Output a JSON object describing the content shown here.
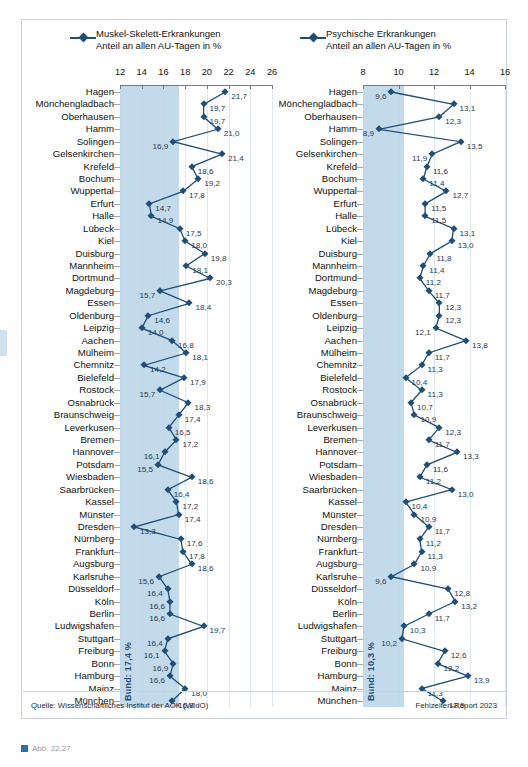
{
  "figure": {
    "source_note": "Quelle: Wissenschaftliches Institut der AOK (WIdO)",
    "report_note": "Fehlzeiten-Report 2023",
    "caption": "Abb. 22.27",
    "accent_color": "#1f4e79",
    "band_color": "#b9d3e8"
  },
  "chart_data": [
    {
      "type": "line",
      "id": "muskel-skelett",
      "title": "Muskel-Skelett-Erkrankungen",
      "subtitle": "Anteil an allen AU-Tagen in %",
      "orientation": "horizontal",
      "xlabel": "Anteil an allen AU-Tagen in %",
      "ylabel": "",
      "xlim": [
        12,
        26
      ],
      "xticks": [
        12,
        14,
        16,
        18,
        20,
        22,
        24,
        26
      ],
      "grid": true,
      "legend_position": "top",
      "reference_band": {
        "label": "Bund: 17,4 %",
        "from": 12,
        "to": 17.4
      },
      "categories": [
        "Hagen",
        "Mönchengladbach",
        "Oberhausen",
        "Hamm",
        "Solingen",
        "Gelsenkirchen",
        "Krefeld",
        "Bochum",
        "Wuppertal",
        "Erfurt",
        "Halle",
        "Lübeck",
        "Kiel",
        "Duisburg",
        "Mannheim",
        "Dortmund",
        "Magdeburg",
        "Essen",
        "Oldenburg",
        "Leipzig",
        "Aachen",
        "Mülheim",
        "Chemnitz",
        "Bielefeld",
        "Rostock",
        "Osnabrück",
        "Braunschweig",
        "Leverkusen",
        "Bremen",
        "Hannover",
        "Potsdam",
        "Wiesbaden",
        "Saarbrücken",
        "Kassel",
        "Münster",
        "Dresden",
        "Nürnberg",
        "Frankfurt",
        "Augsburg",
        "Karlsruhe",
        "Düsseldorf",
        "Köln",
        "Berlin",
        "Ludwigshafen",
        "Stuttgart",
        "Freiburg",
        "Bonn",
        "Hamburg",
        "Mainz",
        "München"
      ],
      "values": [
        21.7,
        19.7,
        19.7,
        21.0,
        16.9,
        21.4,
        18.6,
        19.2,
        17.8,
        14.7,
        14.9,
        17.5,
        18.0,
        19.8,
        18.1,
        20.3,
        15.7,
        18.4,
        14.6,
        14.0,
        16.8,
        18.1,
        14.2,
        17.9,
        15.7,
        18.3,
        17.4,
        16.5,
        17.2,
        16.1,
        15.5,
        18.6,
        16.4,
        17.2,
        17.4,
        13.3,
        17.6,
        17.8,
        18.6,
        15.6,
        16.4,
        16.6,
        16.6,
        19.7,
        16.4,
        16.1,
        16.9,
        16.6,
        18.0,
        16.8
      ],
      "value_labels": [
        "21,7",
        "19,7",
        "19,7",
        "21,0",
        "16,9",
        "21,4",
        "18,6",
        "19,2",
        "17,8",
        "14,7",
        "14,9",
        "17,5",
        "18,0",
        "19,8",
        "18,1",
        "20,3",
        "15,7",
        "18,4",
        "14,6",
        "14,0",
        "16,8",
        "18,1",
        "14,2",
        "17,9",
        "15,7",
        "18,3",
        "17,4",
        "16,5",
        "17,2",
        "16,1",
        "15,5",
        "18,6",
        "16,4",
        "17,2",
        "17,4",
        "13,3",
        "17,6",
        "17,8",
        "18,6",
        "15,6",
        "16,4",
        "16,6",
        "16,6",
        "19,7",
        "16,4",
        "16,1",
        "16,9",
        "16,6",
        "18,0",
        "16,8"
      ],
      "label_side": [
        "r",
        "r",
        "r",
        "r",
        "l",
        "r",
        "r",
        "r",
        "r",
        "r",
        "r",
        "r",
        "r",
        "r",
        "r",
        "r",
        "l",
        "r",
        "r",
        "r",
        "r",
        "r",
        "r",
        "r",
        "l",
        "r",
        "r",
        "r",
        "r",
        "l",
        "l",
        "r",
        "r",
        "r",
        "r",
        "r",
        "r",
        "r",
        "r",
        "l",
        "l",
        "l",
        "l",
        "r",
        "l",
        "l",
        "l",
        "l",
        "r",
        "r"
      ]
    },
    {
      "type": "line",
      "id": "psychische",
      "title": "Psychische Erkrankungen",
      "subtitle": "Anteil an allen AU-Tagen in %",
      "orientation": "horizontal",
      "xlabel": "Anteil an allen AU-Tagen in %",
      "ylabel": "",
      "xlim": [
        8,
        16
      ],
      "xticks": [
        8,
        10,
        12,
        14,
        16
      ],
      "grid": true,
      "legend_position": "top",
      "reference_band": {
        "label": "Bund: 10,3 %",
        "from": 8,
        "to": 10.3
      },
      "categories": [
        "Hagen",
        "Mönchengladbach",
        "Oberhausen",
        "Hamm",
        "Solingen",
        "Gelsenkirchen",
        "Krefeld",
        "Bochum",
        "Wuppertal",
        "Erfurt",
        "Halle",
        "Lübeck",
        "Kiel",
        "Duisburg",
        "Mannheim",
        "Dortmund",
        "Magdeburg",
        "Essen",
        "Oldenburg",
        "Leipzig",
        "Aachen",
        "Mülheim",
        "Chemnitz",
        "Bielefeld",
        "Rostock",
        "Osnabrück",
        "Braunschweig",
        "Leverkusen",
        "Bremen",
        "Hannover",
        "Potsdam",
        "Wiesbaden",
        "Saarbrücken",
        "Kassel",
        "Münster",
        "Dresden",
        "Nürnberg",
        "Frankfurt",
        "Augsburg",
        "Karlsruhe",
        "Düsseldorf",
        "Köln",
        "Berlin",
        "Ludwigshafen",
        "Stuttgart",
        "Freiburg",
        "Bonn",
        "Hamburg",
        "Mainz",
        "München"
      ],
      "values": [
        9.6,
        13.1,
        12.3,
        8.9,
        13.5,
        11.9,
        11.6,
        11.4,
        12.7,
        11.5,
        11.5,
        13.1,
        13.0,
        11.8,
        11.4,
        11.2,
        11.7,
        12.3,
        12.3,
        12.1,
        13.8,
        11.7,
        11.3,
        10.4,
        11.3,
        10.7,
        10.9,
        12.3,
        11.7,
        13.3,
        11.6,
        11.2,
        13.0,
        10.4,
        10.9,
        11.7,
        11.2,
        11.3,
        10.9,
        9.6,
        12.8,
        13.2,
        11.7,
        10.3,
        10.2,
        12.6,
        12.2,
        13.9,
        11.3,
        12.5
      ],
      "value_labels": [
        "9,6",
        "13,1",
        "12,3",
        "8,9",
        "13,5",
        "11,9",
        "11,6",
        "11,4",
        "12,7",
        "11,5",
        "11,5",
        "13,1",
        "13,0",
        "11,8",
        "11,4",
        "11,2",
        "11,7",
        "12,3",
        "12,3",
        "12,1",
        "13,8",
        "11,7",
        "11,3",
        "10,4",
        "11,3",
        "10,7",
        "10,9",
        "12,3",
        "11,7",
        "13,3",
        "11,6",
        "11,2",
        "13,0",
        "10,4",
        "10,9",
        "11,7",
        "11,2",
        "11,3",
        "10,9",
        "9,6",
        "12,8",
        "13,2",
        "11,7",
        "10,3",
        "10,2",
        "12,6",
        "12,2",
        "13,9",
        "11,3",
        "12,5"
      ],
      "label_side": [
        "l",
        "r",
        "r",
        "l",
        "r",
        "l",
        "r",
        "r",
        "r",
        "r",
        "r",
        "r",
        "r",
        "r",
        "r",
        "r",
        "r",
        "r",
        "r",
        "l",
        "r",
        "r",
        "r",
        "r",
        "r",
        "r",
        "r",
        "r",
        "r",
        "r",
        "r",
        "r",
        "r",
        "r",
        "r",
        "r",
        "r",
        "r",
        "r",
        "l",
        "r",
        "r",
        "r",
        "r",
        "l",
        "r",
        "r",
        "r",
        "r",
        "r"
      ]
    }
  ]
}
